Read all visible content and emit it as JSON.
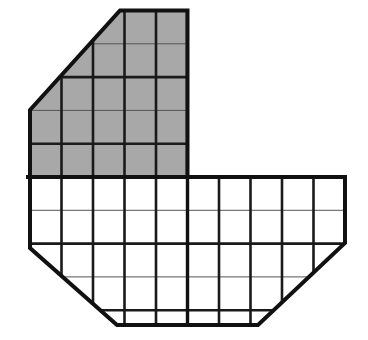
{
  "figure": {
    "canvas": {
      "width": 368,
      "height": 340
    },
    "colors": {
      "background": "#ffffff",
      "shaded_fill": "#a8a8a8",
      "unshaded_fill": "#ffffff",
      "outline_stroke": "#111111",
      "grid_major_stroke": "#1a1a1a",
      "grid_minor_stroke": "#555555"
    },
    "grid": {
      "cell_width": 31.5,
      "cell_height": 33.3,
      "origin_x": 30,
      "origin_y": 10.5,
      "columns": 10,
      "rows": 9.5,
      "outline_width": 4.0,
      "major_line_width": 2.6,
      "minor_line_width": 1.0
    },
    "regions": [
      {
        "name": "shaded-upper-block",
        "fill": "shaded",
        "columns": 5,
        "rows": 5,
        "x_range": [
          30,
          187.5
        ],
        "y_range": [
          10.5,
          177
        ],
        "corner_cut": "top-left diagonal from (30,110) to (120,10.5)"
      },
      {
        "name": "unshaded-lower-block",
        "fill": "unshaded",
        "columns": 10,
        "rows": 4.45,
        "x_range": [
          30,
          345
        ],
        "y_range": [
          177,
          325
        ],
        "corner_cut": "bottom-left diagonal from (30,248) to (117,325); bottom-right diagonal from (258,325) to (345,243)"
      }
    ],
    "outline_points": [
      [
        120,
        10.5
      ],
      [
        187.5,
        10.5
      ],
      [
        187.5,
        177
      ],
      [
        345,
        177
      ],
      [
        345,
        243
      ],
      [
        258,
        325
      ],
      [
        117,
        325
      ],
      [
        30,
        248
      ],
      [
        30,
        110
      ]
    ],
    "vertical_grid_x": [
      30,
      61.5,
      93,
      124.5,
      156,
      187.5,
      219,
      250.5,
      282,
      313.5,
      345
    ],
    "horizontal_grid_y": [
      10.5,
      43.8,
      77.1,
      110.4,
      143.7,
      177,
      210.3,
      243.6,
      276.9,
      310.2,
      325
    ],
    "major_vertical_x": [
      30,
      61.5,
      93,
      124.5,
      156,
      187.5,
      219,
      250.5,
      282,
      313.5,
      345
    ],
    "major_horizontal_y": [
      10.5,
      77.1,
      143.7,
      177,
      243.6,
      310.2,
      325
    ],
    "minor_horizontal_y": [
      43.8,
      110.4,
      210.3,
      276.9
    ]
  }
}
